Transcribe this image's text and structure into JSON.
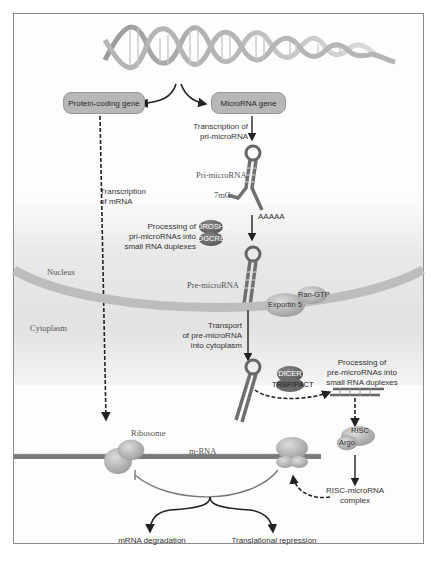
{
  "diagram": {
    "genes": {
      "protein_coding": "Protein-coding gene",
      "microrna": "MicroRNA gene"
    },
    "compartments": {
      "nucleus": "Nucleus",
      "cytoplasm": "Cytoplasm"
    },
    "steps": {
      "transcription_mrna": [
        "Transcription",
        "of mRNA"
      ],
      "transcription_pri": [
        "Transcription of",
        "pri-microRNA"
      ],
      "processing_pri": [
        "Processing of",
        "pri-microRNAs into",
        "small RNA duplexes"
      ],
      "transport": [
        "Transport",
        "of pre-microRNA",
        "into cytoplasm"
      ],
      "processing_pre": [
        "Processing of",
        "pre-microRNAs into",
        "small RNA duplexes"
      ]
    },
    "molecules": {
      "pri_microrna": "Pri-microRNA",
      "cap": "7mG",
      "polya": "AAAAA",
      "pre_microrna": "Pre-microRNA",
      "drosha": "DROSHA",
      "dgcr8": "DGCR8",
      "exportin": "Exportin 5",
      "ran_gtp": "Ran-GTP",
      "dicer": "DICER",
      "trbp": "TRBP/PACT",
      "risc": "RISC",
      "argo": "Argo",
      "risc_complex": [
        "RISC-microRNA",
        "complex"
      ],
      "ribosome": "Ribosome",
      "mrna": "m-RNA"
    },
    "outcomes": {
      "degradation": "mRNA degradation",
      "repression": "Translational repression"
    },
    "colors": {
      "box_fill": "#b7b7b7",
      "dna": "#c8c8c8",
      "rna_strand": "#707070",
      "protein_dark": "#6e6e6e",
      "protein_light": "#bdbdbd",
      "membrane": "#bcbcbc",
      "arrow": "#222222"
    }
  }
}
